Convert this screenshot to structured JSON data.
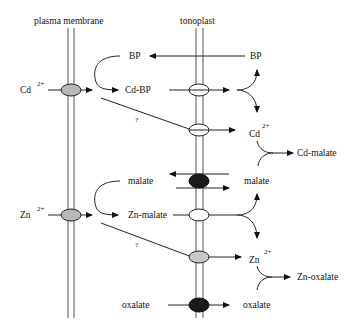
{
  "diagram": {
    "membranes": {
      "plasma_membrane": "plasma membrane",
      "tonoplast": "tonoplast"
    },
    "labels": {
      "cd_ion_left": "Cd",
      "cd_ion_left_charge": "2+",
      "bp_left": "BP",
      "bp_right": "BP",
      "cd_bp": "Cd-BP",
      "unknown_1": "?",
      "cd_ion_right": "Cd",
      "cd_ion_right_charge": "2+",
      "cd_malate": "Cd-malate",
      "malate_left": "malate",
      "malate_right": "malate",
      "zn_ion_left": "Zn",
      "zn_ion_left_charge": "2+",
      "zn_malate": "Zn-malate",
      "unknown_2": "?",
      "zn_ion_right": "Zn",
      "zn_ion_right_charge": "2+",
      "zn_oxalate": "Zn-oxalate",
      "oxalate_left": "oxalate",
      "oxalate_right": "oxalate"
    },
    "colors": {
      "gray_transporter": "#b8b8b8",
      "white_transporter": "#ffffff",
      "black_transporter": "#1a1a1a"
    }
  }
}
